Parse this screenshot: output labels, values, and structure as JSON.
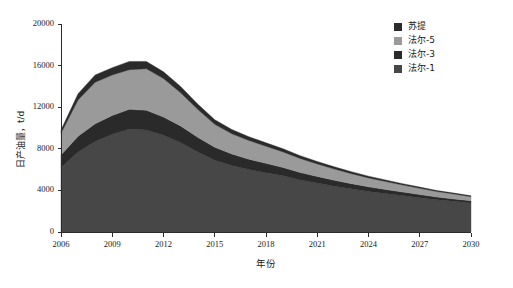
{
  "chart_data": {
    "type": "area",
    "stacked": true,
    "title": "",
    "xlabel": "年份",
    "ylabel": "日产油量，t/d",
    "xlim": [
      2006,
      2030
    ],
    "ylim": [
      0,
      20000
    ],
    "ytick_labels": [
      "0",
      "4000",
      "8000",
      "12000",
      "16000",
      "20000"
    ],
    "yticks": [
      0,
      4000,
      8000,
      12000,
      16000,
      20000
    ],
    "xtick_labels": [
      "2006",
      "2009",
      "2012",
      "2015",
      "2018",
      "2021",
      "2024",
      "2027",
      "2030"
    ],
    "xticks": [
      2006,
      2009,
      2012,
      2015,
      2018,
      2021,
      2024,
      2027,
      2030
    ],
    "grid": false,
    "legend_position": "top-right",
    "x": [
      2006,
      2007,
      2008,
      2009,
      2010,
      2011,
      2012,
      2013,
      2014,
      2015,
      2016,
      2017,
      2018,
      2019,
      2020,
      2021,
      2022,
      2023,
      2024,
      2025,
      2026,
      2027,
      2028,
      2029,
      2030
    ],
    "series": [
      {
        "name": "法尔-1",
        "color": "#474747",
        "values": [
          6200,
          7700,
          8700,
          9400,
          9900,
          9800,
          9300,
          8600,
          7700,
          6900,
          6400,
          6000,
          5700,
          5400,
          5000,
          4700,
          4400,
          4150,
          3900,
          3700,
          3500,
          3300,
          3100,
          2950,
          2800
        ]
      },
      {
        "name": "法尔-3",
        "color": "#2a2a2a",
        "values": [
          1200,
          1500,
          1700,
          1800,
          1900,
          1900,
          1750,
          1600,
          1400,
          1250,
          1100,
          1000,
          900,
          800,
          720,
          640,
          570,
          500,
          440,
          390,
          340,
          300,
          260,
          230,
          200
        ]
      },
      {
        "name": "法尔-5",
        "color": "#9a9a9a",
        "values": [
          2100,
          3500,
          4000,
          3900,
          3800,
          4000,
          3700,
          3200,
          2700,
          2200,
          1950,
          1800,
          1650,
          1500,
          1350,
          1200,
          1080,
          960,
          860,
          760,
          680,
          600,
          530,
          470,
          400
        ]
      },
      {
        "name": "苏提",
        "color": "#2b2b2b",
        "values": [
          300,
          600,
          700,
          700,
          800,
          700,
          650,
          600,
          500,
          450,
          400,
          360,
          330,
          300,
          270,
          240,
          215,
          190,
          170,
          150,
          130,
          115,
          100,
          90,
          80
        ]
      }
    ],
    "legend": [
      {
        "label": "苏提",
        "color": "#2b2b2b"
      },
      {
        "label": "法尔-5",
        "color": "#9a9a9a"
      },
      {
        "label": "法尔-3",
        "color": "#2a2a2a"
      },
      {
        "label": "法尔-1",
        "color": "#474747"
      }
    ]
  }
}
